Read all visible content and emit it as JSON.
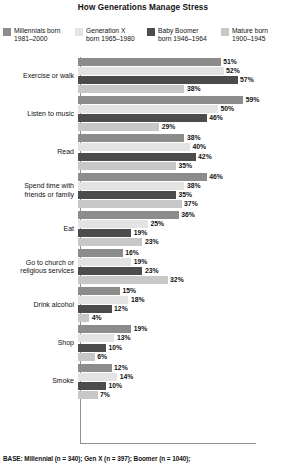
{
  "chart_data": {
    "type": "bar",
    "orientation": "horizontal",
    "title": "How Generations Manage Stress",
    "xlabel": "",
    "ylabel": "",
    "xlim": [
      0,
      60
    ],
    "grid": false,
    "legend_position": "top",
    "value_suffix": "%",
    "categories": [
      "Exercise or walk",
      "Listen to music",
      "Read",
      "Spend time with friends or family",
      "Eat",
      "Go to church or religious services",
      "Drink alcohol",
      "Shop",
      "Smoke"
    ],
    "series": [
      {
        "name": "Millennials born 1981–2000",
        "color": "#8c8c8c",
        "values": [
          51,
          59,
          38,
          46,
          36,
          16,
          15,
          19,
          12
        ]
      },
      {
        "name": "Generation X born 1965–1980",
        "color": "#e3e3e3",
        "values": [
          52,
          50,
          40,
          38,
          25,
          19,
          18,
          13,
          14
        ]
      },
      {
        "name": "Baby Boomer born 1946–1964",
        "color": "#4c4c4c",
        "values": [
          57,
          46,
          42,
          35,
          19,
          23,
          12,
          10,
          10
        ]
      },
      {
        "name": "Mature born 1900–1945",
        "color": "#c7c7c7",
        "values": [
          38,
          29,
          35,
          37,
          23,
          32,
          4,
          6,
          7
        ]
      }
    ]
  },
  "legend": {
    "items": [
      {
        "line1": "Millennials born",
        "line2": "1981–2000",
        "color": "#8c8c8c",
        "swatch_name": "legend-swatch-millennials"
      },
      {
        "line1": "Generation X",
        "line2": "born 1965–1980",
        "color": "#e3e3e3",
        "swatch_name": "legend-swatch-generation-x"
      },
      {
        "line1": "Baby Boomer",
        "line2": "born 1946–1964",
        "color": "#4c4c4c",
        "swatch_name": "legend-swatch-baby-boomer"
      },
      {
        "line1": "Mature born",
        "line2": "1900–1945",
        "color": "#c7c7c7",
        "swatch_name": "legend-swatch-mature"
      }
    ]
  },
  "category_labels": [
    {
      "l1": "Exercise or walk",
      "l2": ""
    },
    {
      "l1": "Listen to music",
      "l2": ""
    },
    {
      "l1": "Read",
      "l2": ""
    },
    {
      "l1": "Spend time with",
      "l2": "friends or family"
    },
    {
      "l1": "Eat",
      "l2": ""
    },
    {
      "l1": "Go to church or",
      "l2": "religious services"
    },
    {
      "l1": "Drink alcohol",
      "l2": ""
    },
    {
      "l1": "Shop",
      "l2": ""
    },
    {
      "l1": "Smoke",
      "l2": ""
    }
  ],
  "footer": {
    "base_note": "BASE: Millennial (n = 340); Gen X (n = 397); Boomer (n = 1040);"
  }
}
